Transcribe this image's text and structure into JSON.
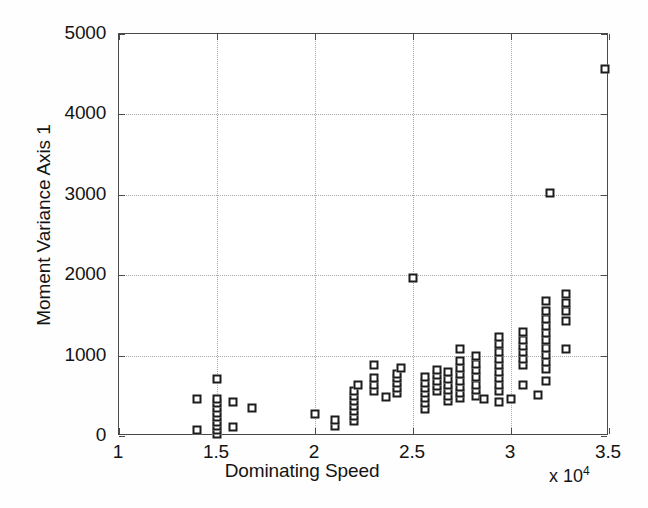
{
  "chart_data": {
    "type": "scatter",
    "title": "",
    "xlabel": "Dominating Speed",
    "ylabel": "Moment Variance Axis 1",
    "x_multiplier_label": "x 10",
    "x_multiplier_exponent": "4",
    "x_scale_factor": 10000,
    "xlim": [
      1.0,
      3.5
    ],
    "ylim": [
      0,
      5000
    ],
    "xticks": [
      1,
      1.5,
      2,
      2.5,
      3,
      3.5
    ],
    "xtick_labels": [
      "1",
      "1.5",
      "2",
      "2.5",
      "3",
      "3.5"
    ],
    "yticks": [
      0,
      1000,
      2000,
      3000,
      4000,
      5000
    ],
    "ytick_labels": [
      "0",
      "1000",
      "2000",
      "3000",
      "4000",
      "5000"
    ],
    "grid": true,
    "grid_style": "dotted",
    "legend": null,
    "marker": "square",
    "marker_filled": false,
    "marker_color": "#1c1c1c",
    "marker_size_px": 9,
    "axis_color": "#4a4a4a",
    "grid_color": "#a8a8a8",
    "background": "#ffffff",
    "note": "x values in units of 10^4 (Dominating Speed); y values are Moment Variance Axis 1",
    "points": [
      [
        1.4,
        80
      ],
      [
        1.4,
        460
      ],
      [
        1.5,
        20
      ],
      [
        1.5,
        70
      ],
      [
        1.5,
        120
      ],
      [
        1.5,
        175
      ],
      [
        1.5,
        235
      ],
      [
        1.5,
        290
      ],
      [
        1.5,
        350
      ],
      [
        1.5,
        405
      ],
      [
        1.5,
        455
      ],
      [
        1.5,
        710
      ],
      [
        1.58,
        110
      ],
      [
        1.58,
        420
      ],
      [
        1.68,
        350
      ],
      [
        2.0,
        275
      ],
      [
        2.1,
        120
      ],
      [
        2.1,
        205
      ],
      [
        2.2,
        185
      ],
      [
        2.2,
        250
      ],
      [
        2.2,
        310
      ],
      [
        2.2,
        375
      ],
      [
        2.2,
        440
      ],
      [
        2.2,
        500
      ],
      [
        2.2,
        565
      ],
      [
        2.22,
        640
      ],
      [
        2.3,
        560
      ],
      [
        2.3,
        640
      ],
      [
        2.3,
        720
      ],
      [
        2.3,
        880
      ],
      [
        2.36,
        490
      ],
      [
        2.42,
        530
      ],
      [
        2.42,
        600
      ],
      [
        2.42,
        660
      ],
      [
        2.42,
        720
      ],
      [
        2.42,
        775
      ],
      [
        2.44,
        850
      ],
      [
        2.5,
        1970
      ],
      [
        2.56,
        340
      ],
      [
        2.56,
        405
      ],
      [
        2.56,
        470
      ],
      [
        2.56,
        535
      ],
      [
        2.56,
        600
      ],
      [
        2.56,
        665
      ],
      [
        2.56,
        730
      ],
      [
        2.62,
        560
      ],
      [
        2.62,
        625
      ],
      [
        2.62,
        690
      ],
      [
        2.62,
        755
      ],
      [
        2.62,
        820
      ],
      [
        2.68,
        430
      ],
      [
        2.68,
        500
      ],
      [
        2.68,
        570
      ],
      [
        2.68,
        640
      ],
      [
        2.68,
        710
      ],
      [
        2.68,
        790
      ],
      [
        2.74,
        470
      ],
      [
        2.74,
        540
      ],
      [
        2.74,
        610
      ],
      [
        2.74,
        690
      ],
      [
        2.74,
        770
      ],
      [
        2.74,
        850
      ],
      [
        2.74,
        930
      ],
      [
        2.74,
        1080
      ],
      [
        2.82,
        500
      ],
      [
        2.82,
        570
      ],
      [
        2.82,
        640
      ],
      [
        2.82,
        730
      ],
      [
        2.82,
        820
      ],
      [
        2.82,
        900
      ],
      [
        2.82,
        1000
      ],
      [
        2.86,
        460
      ],
      [
        2.94,
        420
      ],
      [
        2.94,
        560
      ],
      [
        2.94,
        640
      ],
      [
        2.94,
        720
      ],
      [
        2.94,
        800
      ],
      [
        2.94,
        880
      ],
      [
        2.94,
        960
      ],
      [
        2.94,
        1050
      ],
      [
        2.94,
        1140
      ],
      [
        2.94,
        1230
      ],
      [
        3.0,
        460
      ],
      [
        3.06,
        640
      ],
      [
        3.06,
        880
      ],
      [
        3.06,
        960
      ],
      [
        3.06,
        1040
      ],
      [
        3.06,
        1120
      ],
      [
        3.06,
        1200
      ],
      [
        3.06,
        1290
      ],
      [
        3.14,
        510
      ],
      [
        3.18,
        680
      ],
      [
        3.18,
        830
      ],
      [
        3.18,
        920
      ],
      [
        3.18,
        1010
      ],
      [
        3.18,
        1100
      ],
      [
        3.18,
        1190
      ],
      [
        3.18,
        1280
      ],
      [
        3.18,
        1370
      ],
      [
        3.18,
        1460
      ],
      [
        3.18,
        1550
      ],
      [
        3.18,
        1680
      ],
      [
        3.2,
        3020
      ],
      [
        3.28,
        1080
      ],
      [
        3.28,
        1430
      ],
      [
        3.28,
        1560
      ],
      [
        3.28,
        1660
      ],
      [
        3.28,
        1760
      ],
      [
        3.48,
        4570
      ]
    ]
  }
}
